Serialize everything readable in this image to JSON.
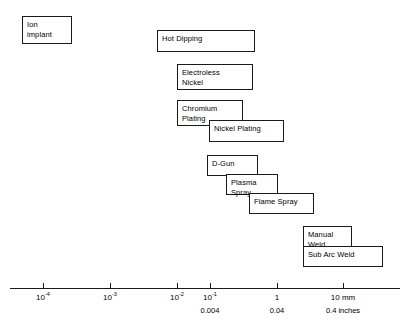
{
  "diagram": {
    "type": "range-bar-log-scale",
    "processes": [
      {
        "label": "Ion\nimplant",
        "x": 22,
        "y": 16,
        "width": 50,
        "height": 28
      },
      {
        "label": "Hot Dipping",
        "x": 157,
        "y": 30,
        "width": 98,
        "height": 22
      },
      {
        "label": "Electroless\nNickel",
        "x": 177,
        "y": 64,
        "width": 76,
        "height": 26
      },
      {
        "label": "Chromium\nPlating",
        "x": 177,
        "y": 100,
        "width": 66,
        "height": 26
      },
      {
        "label": "Nickel Plating",
        "x": 209,
        "y": 120,
        "width": 75,
        "height": 22
      },
      {
        "label": "D-Gun",
        "x": 207,
        "y": 155,
        "width": 51,
        "height": 21
      },
      {
        "label": "Plasma Spray",
        "x": 226,
        "y": 174,
        "width": 52,
        "height": 21
      },
      {
        "label": "Flame Spray",
        "x": 249,
        "y": 193,
        "width": 65,
        "height": 21
      },
      {
        "label": "Manual\nWeld",
        "x": 303,
        "y": 226,
        "width": 49,
        "height": 26
      },
      {
        "label": "Sub Arc Weld",
        "x": 303,
        "y": 246,
        "width": 80,
        "height": 21
      }
    ],
    "axis": {
      "x_start": 10,
      "x_end": 400,
      "y": 288,
      "tick_length": 5,
      "ticks": [
        {
          "x": 43,
          "mantissa": "10",
          "exponent": "-4",
          "inches": ""
        },
        {
          "x": 110,
          "mantissa": "10",
          "exponent": "-3",
          "inches": ""
        },
        {
          "x": 177,
          "mantissa": "10",
          "exponent": "-2",
          "inches": ""
        },
        {
          "x": 210,
          "mantissa": "10",
          "exponent": "-1",
          "inches": "0.004"
        },
        {
          "x": 277,
          "mantissa": "1",
          "exponent": "",
          "inches": "0.04"
        },
        {
          "x": 343,
          "mantissa": "10 mm",
          "exponent": "",
          "inches": "0.4 inches"
        }
      ]
    },
    "colors": {
      "line": "#1a1a1a",
      "box_fill": "#ffffff",
      "text": "#000000",
      "background": "#ffffff"
    }
  }
}
